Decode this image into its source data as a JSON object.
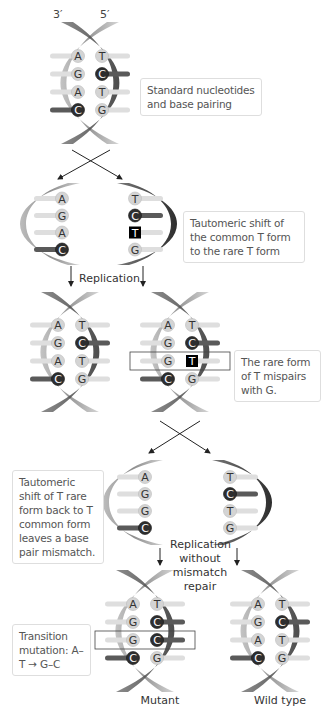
{
  "strand_labels": {
    "left": "3′",
    "right": "5′"
  },
  "notes": {
    "standard": "Standard nucleotides and base pairing",
    "tautomeric_shift": "Tautomeric shift of the common T form to the rare T form",
    "rare_mispair": "The rare form of T mispairs with G.",
    "shift_back": "Tautomeric shift of T rare form back to T common form leaves a base pair mismatch.",
    "transition": "Transition mutation: A–T → G–C"
  },
  "labels": {
    "replication": "Replication",
    "replication_no_repair": "Replication without mismatch repair",
    "mutant": "Mutant",
    "wild_type": "Wild type"
  },
  "colors": {
    "purine_light": "#d6d6d6",
    "dark_base": "#333333",
    "rare_T": "#000000",
    "strand": "#9a9a9a",
    "strand_dark": "#444444"
  },
  "helices": [
    {
      "id": "original",
      "pairs": [
        [
          "A",
          "T"
        ],
        [
          "G",
          "C"
        ],
        [
          "A",
          "T"
        ],
        [
          "C",
          "G"
        ]
      ]
    },
    {
      "id": "left-parent-strand",
      "bases": [
        "A",
        "G",
        "A",
        "C"
      ]
    },
    {
      "id": "right-parent-strand",
      "bases": [
        "T",
        "C",
        "T*",
        "G"
      ]
    },
    {
      "id": "replicated-left",
      "pairs": [
        [
          "A",
          "T"
        ],
        [
          "G",
          "C"
        ],
        [
          "A",
          "T"
        ],
        [
          "C",
          "G"
        ]
      ]
    },
    {
      "id": "replicated-right",
      "pairs": [
        [
          "A",
          "T"
        ],
        [
          "G",
          "C"
        ],
        [
          "G",
          "T*"
        ],
        [
          "C",
          "G"
        ]
      ],
      "highlight_row": 2
    },
    {
      "id": "mismatch-left-strand",
      "bases": [
        "A",
        "G",
        "G",
        "C"
      ]
    },
    {
      "id": "mismatch-right-strand",
      "bases": [
        "T",
        "C",
        "T",
        "G"
      ]
    },
    {
      "id": "mutant",
      "pairs": [
        [
          "A",
          "T"
        ],
        [
          "G",
          "C"
        ],
        [
          "G",
          "C"
        ],
        [
          "C",
          "G"
        ]
      ],
      "highlight_row": 2
    },
    {
      "id": "wild-type",
      "pairs": [
        [
          "A",
          "T"
        ],
        [
          "G",
          "C"
        ],
        [
          "A",
          "T"
        ],
        [
          "C",
          "G"
        ]
      ]
    }
  ]
}
